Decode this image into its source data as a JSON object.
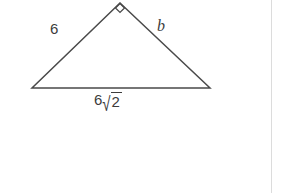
{
  "figure": {
    "kind": "right-triangle-diagram",
    "background_color": "#ffffff",
    "stroke_color": "#4a4a4a",
    "text_color": "#3c3c3c",
    "stroke_width": 1.5,
    "vertices": {
      "apex": {
        "x": 120,
        "y": 3
      },
      "bottom_left": {
        "x": 32,
        "y": 88
      },
      "bottom_right": {
        "x": 210,
        "y": 88
      }
    },
    "right_angle_marker": {
      "name": "right-angle-marker",
      "at_vertex": "apex",
      "shape": "diamond",
      "size": 9,
      "filled": false
    }
  },
  "labels": {
    "left_leg": "6",
    "right_leg": "b",
    "base_coefficient": "6",
    "base_radical_sign": "√",
    "base_radicand": "2",
    "base_full": "6√2"
  },
  "divider": {
    "name": "right-divider",
    "color": "#dcdcdc",
    "x": 271
  }
}
